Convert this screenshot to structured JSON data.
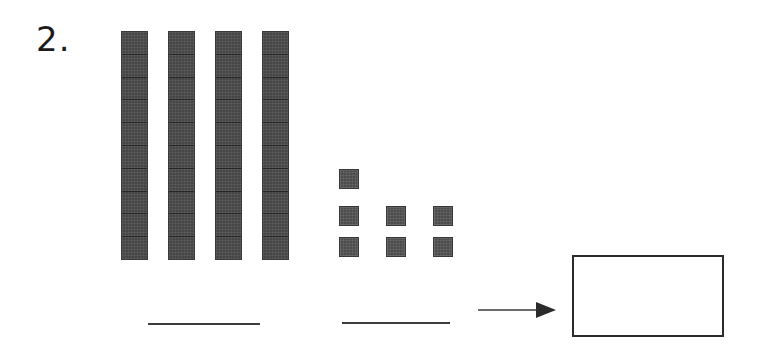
{
  "worksheet": {
    "problem_number": "2.",
    "ink_color": "#3d3d3d",
    "block_color": "#4e4e4e",
    "background_color": "#ffffff"
  },
  "manipulatives": {
    "tens": {
      "label": "tens-rods",
      "count": 4,
      "units_per_rod": 10,
      "value": 40
    },
    "ones": {
      "label": "unit-cubes",
      "count": 7,
      "value": 7,
      "rows": [
        1,
        3,
        3
      ]
    },
    "total_value": 47
  },
  "answers": {
    "tens_blank_value": "",
    "ones_blank_value": "",
    "answer_box_value": ""
  },
  "icons": {
    "arrow": "right-arrow-icon"
  }
}
